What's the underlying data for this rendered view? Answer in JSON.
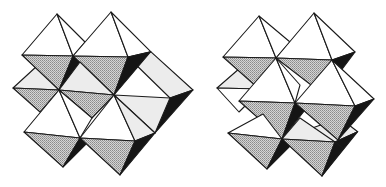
{
  "figure": {
    "panels": [
      {
        "id": "left",
        "label": "octahedral cluster A"
      },
      {
        "id": "right",
        "label": "octahedral cluster B"
      }
    ],
    "colors": {
      "edge": "#1a1a1a",
      "top_face": "#ffffff",
      "shaded_face": "#b8b8b8",
      "shadow_face": "#151515",
      "background": "#ffffff"
    }
  }
}
